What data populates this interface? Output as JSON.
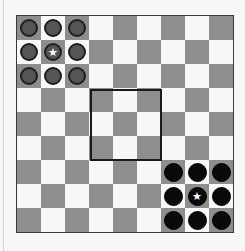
{
  "game": {
    "board": {
      "rows": 9,
      "cols": 9,
      "colors": {
        "dark_square": "#8e8e8e",
        "light_square": "#f8f8f8",
        "border": "#3a3a3a"
      },
      "pattern": "dark when (row+col) is even"
    },
    "center_zone": {
      "rows": [
        3,
        5
      ],
      "cols": [
        3,
        5
      ],
      "outline_color": "#1a1a1a"
    },
    "players": [
      {
        "name": "gray",
        "color": "#555555",
        "pieces": [
          {
            "row": 0,
            "col": 0,
            "star": false
          },
          {
            "row": 0,
            "col": 1,
            "star": false
          },
          {
            "row": 0,
            "col": 2,
            "star": false
          },
          {
            "row": 1,
            "col": 0,
            "star": false
          },
          {
            "row": 1,
            "col": 1,
            "star": true
          },
          {
            "row": 1,
            "col": 2,
            "star": false
          },
          {
            "row": 2,
            "col": 0,
            "star": false
          },
          {
            "row": 2,
            "col": 1,
            "star": false
          },
          {
            "row": 2,
            "col": 2,
            "star": false
          }
        ]
      },
      {
        "name": "black",
        "color": "#0a0a0a",
        "pieces": [
          {
            "row": 6,
            "col": 6,
            "star": false
          },
          {
            "row": 6,
            "col": 7,
            "star": false
          },
          {
            "row": 6,
            "col": 8,
            "star": false
          },
          {
            "row": 7,
            "col": 6,
            "star": false
          },
          {
            "row": 7,
            "col": 7,
            "star": true
          },
          {
            "row": 7,
            "col": 8,
            "star": false
          },
          {
            "row": 8,
            "col": 6,
            "star": false
          },
          {
            "row": 8,
            "col": 7,
            "star": false
          },
          {
            "row": 8,
            "col": 8,
            "star": false
          }
        ]
      }
    ],
    "icons": {
      "star": "★"
    }
  }
}
